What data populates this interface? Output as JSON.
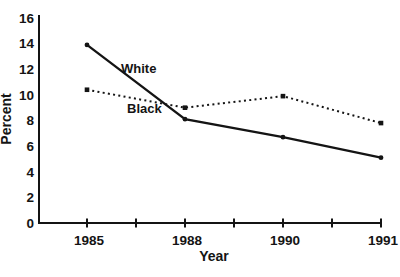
{
  "page": {
    "background": "#ffffff"
  },
  "chart_data": {
    "type": "line",
    "title": "",
    "xlabel": "Year",
    "ylabel": "Percent",
    "categories": [
      "1985",
      "1988",
      "1990",
      "1991"
    ],
    "series": [
      {
        "name": "White",
        "style": "solid",
        "marker": "circle",
        "values": [
          13.9,
          8.1,
          6.7,
          5.1
        ]
      },
      {
        "name": "Black",
        "style": "dotted",
        "marker": "square",
        "values": [
          10.4,
          9.0,
          9.9,
          7.8
        ]
      }
    ],
    "ylim": [
      0,
      16
    ],
    "yticks": [
      0,
      2,
      4,
      6,
      8,
      10,
      12,
      14,
      16
    ],
    "grid": false,
    "legend": "inline-labels",
    "ink_color": "#141414"
  }
}
